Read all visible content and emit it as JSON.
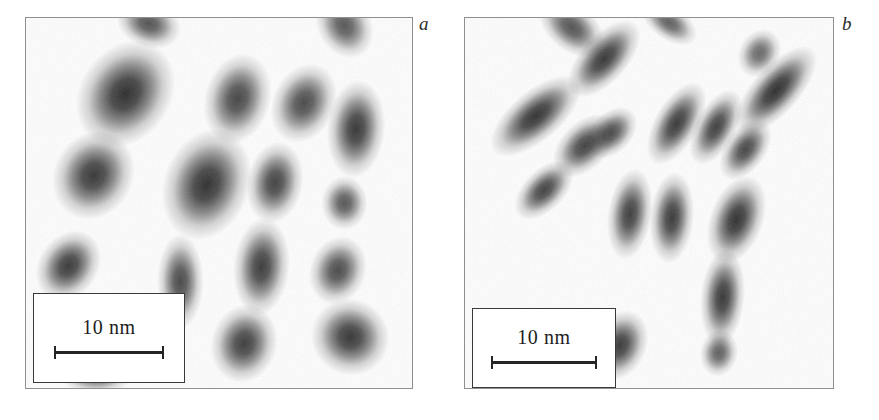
{
  "figure": {
    "background_color": "#ffffff",
    "frame_color": "#8d8f93",
    "particle_color": "#1a1a1a",
    "panel_fill": "#fdfdfd",
    "width": 879,
    "height": 420
  },
  "panels": [
    {
      "id": "panel-a",
      "label": "a",
      "label_x": 419,
      "label_y": 14,
      "frame": {
        "x": 25,
        "y": 17,
        "width": 388,
        "height": 372
      },
      "scalebar": {
        "label": "10 nm",
        "bar_length_px": 110,
        "box": {
          "x": 7,
          "y": 275,
          "width": 152,
          "height": 90
        }
      },
      "particles": [
        {
          "cx": 0.318,
          "cy": 0.015,
          "rx": 0.04,
          "ry": 0.03,
          "angle": 20,
          "intensity": 0.8
        },
        {
          "cx": 0.825,
          "cy": 0.02,
          "rx": 0.042,
          "ry": 0.034,
          "angle": 60,
          "intensity": 0.78
        },
        {
          "cx": 0.258,
          "cy": 0.205,
          "rx": 0.055,
          "ry": 0.072,
          "angle": 35,
          "intensity": 0.97
        },
        {
          "cx": 0.548,
          "cy": 0.218,
          "rx": 0.04,
          "ry": 0.058,
          "angle": 15,
          "intensity": 0.86
        },
        {
          "cx": 0.72,
          "cy": 0.23,
          "rx": 0.038,
          "ry": 0.052,
          "angle": 25,
          "intensity": 0.84
        },
        {
          "cx": 0.855,
          "cy": 0.3,
          "rx": 0.035,
          "ry": 0.062,
          "angle": 5,
          "intensity": 0.93
        },
        {
          "cx": 0.175,
          "cy": 0.425,
          "rx": 0.048,
          "ry": 0.058,
          "angle": 30,
          "intensity": 0.93
        },
        {
          "cx": 0.468,
          "cy": 0.45,
          "rx": 0.052,
          "ry": 0.072,
          "angle": 20,
          "intensity": 0.96
        },
        {
          "cx": 0.645,
          "cy": 0.445,
          "rx": 0.034,
          "ry": 0.052,
          "angle": 10,
          "intensity": 0.88
        },
        {
          "cx": 0.825,
          "cy": 0.5,
          "rx": 0.028,
          "ry": 0.034,
          "angle": 0,
          "intensity": 0.78
        },
        {
          "cx": 0.11,
          "cy": 0.67,
          "rx": 0.036,
          "ry": 0.048,
          "angle": 35,
          "intensity": 0.92
        },
        {
          "cx": 0.4,
          "cy": 0.712,
          "rx": 0.028,
          "ry": 0.06,
          "angle": 0,
          "intensity": 0.85
        },
        {
          "cx": 0.61,
          "cy": 0.672,
          "rx": 0.034,
          "ry": 0.062,
          "angle": 5,
          "intensity": 0.91
        },
        {
          "cx": 0.808,
          "cy": 0.682,
          "rx": 0.034,
          "ry": 0.044,
          "angle": 20,
          "intensity": 0.84
        },
        {
          "cx": 0.565,
          "cy": 0.88,
          "rx": 0.04,
          "ry": 0.05,
          "angle": 15,
          "intensity": 0.9
        },
        {
          "cx": 0.84,
          "cy": 0.862,
          "rx": 0.048,
          "ry": 0.048,
          "angle": 30,
          "intensity": 0.93
        },
        {
          "cx": 0.182,
          "cy": 0.968,
          "rx": 0.044,
          "ry": 0.022,
          "angle": 0,
          "intensity": 0.7
        }
      ]
    },
    {
      "id": "panel-b",
      "label": "b",
      "label_x": 842,
      "label_y": 14,
      "frame": {
        "x": 464,
        "y": 17,
        "width": 370,
        "height": 372
      },
      "scalebar": {
        "label": "10 nm",
        "bar_length_px": 106,
        "box": {
          "x": 7,
          "y": 290,
          "width": 144,
          "height": 80
        }
      },
      "particles": [
        {
          "cx": 0.29,
          "cy": 0.025,
          "rx": 0.048,
          "ry": 0.03,
          "angle": 40,
          "intensity": 0.8
        },
        {
          "cx": 0.555,
          "cy": 0.012,
          "rx": 0.04,
          "ry": 0.022,
          "angle": 35,
          "intensity": 0.74
        },
        {
          "cx": 0.378,
          "cy": 0.11,
          "rx": 0.03,
          "ry": 0.06,
          "angle": 42,
          "intensity": 0.93
        },
        {
          "cx": 0.8,
          "cy": 0.095,
          "rx": 0.026,
          "ry": 0.032,
          "angle": 30,
          "intensity": 0.7
        },
        {
          "cx": 0.192,
          "cy": 0.265,
          "rx": 0.032,
          "ry": 0.07,
          "angle": 50,
          "intensity": 0.95
        },
        {
          "cx": 0.325,
          "cy": 0.345,
          "rx": 0.03,
          "ry": 0.048,
          "angle": 45,
          "intensity": 0.88
        },
        {
          "cx": 0.398,
          "cy": 0.31,
          "rx": 0.026,
          "ry": 0.038,
          "angle": 45,
          "intensity": 0.82
        },
        {
          "cx": 0.575,
          "cy": 0.285,
          "rx": 0.028,
          "ry": 0.058,
          "angle": 30,
          "intensity": 0.92
        },
        {
          "cx": 0.682,
          "cy": 0.295,
          "rx": 0.026,
          "ry": 0.052,
          "angle": 28,
          "intensity": 0.89
        },
        {
          "cx": 0.845,
          "cy": 0.195,
          "rx": 0.03,
          "ry": 0.07,
          "angle": 42,
          "intensity": 0.97
        },
        {
          "cx": 0.762,
          "cy": 0.355,
          "rx": 0.026,
          "ry": 0.044,
          "angle": 35,
          "intensity": 0.86
        },
        {
          "cx": 0.215,
          "cy": 0.465,
          "rx": 0.026,
          "ry": 0.046,
          "angle": 45,
          "intensity": 0.88
        },
        {
          "cx": 0.448,
          "cy": 0.53,
          "rx": 0.028,
          "ry": 0.058,
          "angle": 8,
          "intensity": 0.9
        },
        {
          "cx": 0.562,
          "cy": 0.54,
          "rx": 0.028,
          "ry": 0.058,
          "angle": 5,
          "intensity": 0.92
        },
        {
          "cx": 0.738,
          "cy": 0.545,
          "rx": 0.034,
          "ry": 0.058,
          "angle": 20,
          "intensity": 0.96
        },
        {
          "cx": 0.7,
          "cy": 0.755,
          "rx": 0.028,
          "ry": 0.062,
          "angle": 5,
          "intensity": 0.93
        },
        {
          "cx": 0.42,
          "cy": 0.885,
          "rx": 0.034,
          "ry": 0.046,
          "angle": 25,
          "intensity": 0.92
        },
        {
          "cx": 0.69,
          "cy": 0.905,
          "rx": 0.024,
          "ry": 0.03,
          "angle": 10,
          "intensity": 0.74
        }
      ]
    }
  ]
}
